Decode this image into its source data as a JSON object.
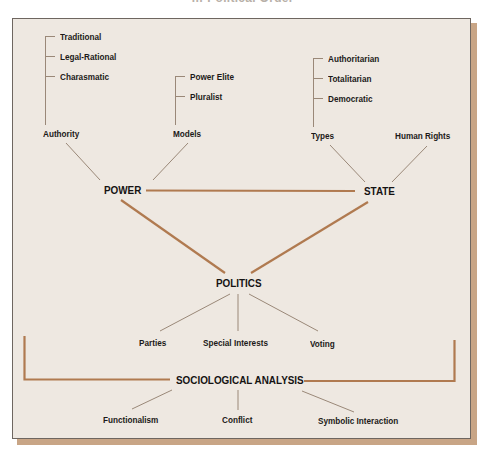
{
  "title": "… Political Order",
  "colors": {
    "background": "#eee8e1",
    "panel_border": "#6e6660",
    "shadow": "#c8a586",
    "thick_line": "#b07a50",
    "thin_line": "#9a8878",
    "text": "#1c1a18"
  },
  "nodes": {
    "power": "POWER",
    "state": "STATE",
    "politics": "POLITICS",
    "sociological_analysis": "SOCIOLOGICAL ANALYSIS"
  },
  "power_branches": {
    "authority": {
      "label": "Authority",
      "children": [
        "Traditional",
        "Legal-Rational",
        "Charasmatic"
      ]
    },
    "models": {
      "label": "Models",
      "children": [
        "Power Elite",
        "Pluralist"
      ]
    }
  },
  "state_branches": {
    "types": {
      "label": "Types",
      "children": [
        "Authoritarian",
        "Totalitarian",
        "Democratic"
      ]
    },
    "human_rights": {
      "label": "Human Rights"
    }
  },
  "politics_branches": [
    "Parties",
    "Special Interests",
    "Voting"
  ],
  "analysis_branches": [
    "Functionalism",
    "Conflict",
    "Symbolic Interaction"
  ]
}
